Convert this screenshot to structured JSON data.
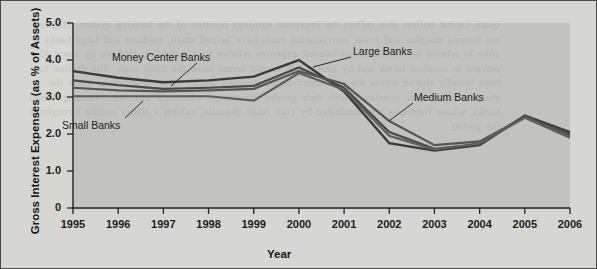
{
  "figure": {
    "background_color": "#d6d6d2",
    "plot_background_color": "#96968f",
    "border_color": "#4a4a48",
    "showthrough_text": "quate capital buffers also reflect the improved earnings position of the banking system. Higher net interest margins and lower provisioning costs have helped small, medium and large banks alike to rebuild net worth. Gross interest expenses relative to assets have declined by some 45 percent in nominal terms and by nearly half in real terms since the 2000 peak. The decline has been broadly shared across the size distribution, although money center institutions show the sharpest adjustment, consistent with their greater reliance on wholesale short-term funding. Small banks, whose liabilities are dominated by core retail deposits, exhibit a flatter profile throughout the period."
  },
  "chart_data": {
    "type": "line",
    "title": "",
    "xlabel": "Year",
    "ylabel": "Gross Interest Expenses (as % of Assets)",
    "x": [
      1995,
      1996,
      1997,
      1998,
      1999,
      2000,
      2001,
      2002,
      2003,
      2004,
      2005,
      2006
    ],
    "xlim": [
      1995,
      2006
    ],
    "ylim": [
      0,
      5.0
    ],
    "yticks": [
      0,
      1.0,
      2.0,
      3.0,
      4.0,
      5.0
    ],
    "ytick_labels": [
      "0",
      "1.0",
      "2.0",
      "3.0",
      "4.0",
      "5.0"
    ],
    "xtick_labels": [
      "1995",
      "1996",
      "1997",
      "1998",
      "1999",
      "2000",
      "2001",
      "2002",
      "2003",
      "2004",
      "2005",
      "2006"
    ],
    "grid": false,
    "legend": "annotations",
    "series": [
      {
        "name": "Money Center Banks",
        "color": "#3a3a38",
        "width": 2.4,
        "values": [
          3.7,
          3.52,
          3.4,
          3.45,
          3.55,
          4.0,
          3.15,
          1.75,
          1.55,
          1.7,
          2.5,
          2.05
        ]
      },
      {
        "name": "Large Banks",
        "color": "#4a4a46",
        "width": 2.2,
        "values": [
          3.45,
          3.32,
          3.22,
          3.25,
          3.3,
          3.8,
          3.25,
          2.05,
          1.6,
          1.72,
          2.48,
          2.0
        ]
      },
      {
        "name": "Medium Banks",
        "color": "#565652",
        "width": 2.2,
        "values": [
          3.25,
          3.18,
          3.15,
          3.18,
          3.22,
          3.7,
          3.35,
          2.35,
          1.7,
          1.8,
          2.46,
          1.95
        ]
      },
      {
        "name": "Small Banks",
        "color": "#5e5e5a",
        "width": 2.2,
        "values": [
          3.02,
          3.02,
          3.02,
          3.02,
          2.9,
          3.65,
          3.2,
          1.95,
          1.58,
          1.75,
          2.44,
          1.9
        ]
      }
    ],
    "annotations": [
      {
        "label": "Money Center Banks",
        "text_x": 111,
        "text_y": 50,
        "leader": [
          [
            196,
            62
          ],
          [
            170,
            85
          ]
        ]
      },
      {
        "label": "Small Banks",
        "text_x": 61,
        "text_y": 118,
        "leader": [
          [
            124,
            117
          ],
          [
            142,
            100
          ]
        ]
      },
      {
        "label": "Large Banks",
        "text_x": 352,
        "text_y": 44,
        "leader": [
          [
            350,
            56
          ],
          [
            312,
            66
          ]
        ]
      },
      {
        "label": "Medium Banks",
        "text_x": 413,
        "text_y": 90,
        "leader": [
          [
            412,
            102
          ],
          [
            388,
            120
          ]
        ]
      }
    ]
  }
}
